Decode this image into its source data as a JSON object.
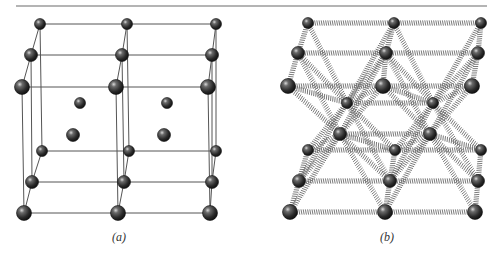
{
  "figure": {
    "rule": {
      "x1": 16,
      "x2": 487,
      "y": 6,
      "color": "#6a6a6a"
    },
    "atom_color": "#2e2e2e",
    "line_color": "#555555",
    "spring_color": "#6b6b6b",
    "panels": [
      {
        "caption": "(a)",
        "caption_pos": [
          112,
          240
        ],
        "style": "lines",
        "atoms": [
          {
            "x": 40,
            "y": 24,
            "r": 5.5
          },
          {
            "x": 127,
            "y": 24,
            "r": 5.5
          },
          {
            "x": 216,
            "y": 24,
            "r": 5.5
          },
          {
            "x": 31,
            "y": 55,
            "r": 6.5
          },
          {
            "x": 122,
            "y": 55,
            "r": 6.5
          },
          {
            "x": 212,
            "y": 55,
            "r": 6.5
          },
          {
            "x": 22,
            "y": 87,
            "r": 7.5
          },
          {
            "x": 116,
            "y": 87,
            "r": 7.5
          },
          {
            "x": 208,
            "y": 87,
            "r": 7.5
          },
          {
            "x": 80,
            "y": 103,
            "r": 5.5
          },
          {
            "x": 167,
            "y": 103,
            "r": 5.5
          },
          {
            "x": 73,
            "y": 135,
            "r": 6.5
          },
          {
            "x": 164,
            "y": 135,
            "r": 6.5
          },
          {
            "x": 42,
            "y": 151,
            "r": 5.5
          },
          {
            "x": 129,
            "y": 151,
            "r": 5.5
          },
          {
            "x": 216,
            "y": 151,
            "r": 5.5
          },
          {
            "x": 32,
            "y": 182,
            "r": 6.5
          },
          {
            "x": 124,
            "y": 182,
            "r": 6.5
          },
          {
            "x": 212,
            "y": 182,
            "r": 6.5
          },
          {
            "x": 24,
            "y": 213,
            "r": 7.5
          },
          {
            "x": 118,
            "y": 213,
            "r": 7.5
          },
          {
            "x": 210,
            "y": 213,
            "r": 7.5
          }
        ],
        "bonds": [
          [
            0,
            1
          ],
          [
            1,
            2
          ],
          [
            3,
            4
          ],
          [
            4,
            5
          ],
          [
            6,
            7
          ],
          [
            7,
            8
          ],
          [
            13,
            14
          ],
          [
            14,
            15
          ],
          [
            16,
            17
          ],
          [
            17,
            18
          ],
          [
            19,
            20
          ],
          [
            20,
            21
          ],
          [
            0,
            3
          ],
          [
            3,
            6
          ],
          [
            1,
            4
          ],
          [
            4,
            7
          ],
          [
            2,
            5
          ],
          [
            5,
            8
          ],
          [
            13,
            16
          ],
          [
            16,
            19
          ],
          [
            14,
            17
          ],
          [
            17,
            20
          ],
          [
            15,
            18
          ],
          [
            18,
            21
          ],
          [
            0,
            13
          ],
          [
            3,
            16
          ],
          [
            6,
            19
          ],
          [
            1,
            14
          ],
          [
            4,
            17
          ],
          [
            7,
            20
          ],
          [
            2,
            15
          ],
          [
            5,
            18
          ],
          [
            8,
            21
          ]
        ]
      },
      {
        "caption": "(b)",
        "caption_pos": [
          380,
          240
        ],
        "style": "springs",
        "atoms": [
          {
            "x": 308,
            "y": 23,
            "r": 5.5
          },
          {
            "x": 394,
            "y": 23,
            "r": 5.5
          },
          {
            "x": 481,
            "y": 23,
            "r": 5.5
          },
          {
            "x": 298,
            "y": 53,
            "r": 6.5
          },
          {
            "x": 386,
            "y": 53,
            "r": 6.5
          },
          {
            "x": 478,
            "y": 53,
            "r": 6.5
          },
          {
            "x": 288,
            "y": 86,
            "r": 7.5
          },
          {
            "x": 383,
            "y": 86,
            "r": 7.5
          },
          {
            "x": 472,
            "y": 86,
            "r": 7.5
          },
          {
            "x": 347,
            "y": 103,
            "r": 5.5
          },
          {
            "x": 433,
            "y": 103,
            "r": 5.5
          },
          {
            "x": 340,
            "y": 134,
            "r": 6.5
          },
          {
            "x": 430,
            "y": 134,
            "r": 6.5
          },
          {
            "x": 308,
            "y": 150,
            "r": 5.5
          },
          {
            "x": 395,
            "y": 150,
            "r": 5.5
          },
          {
            "x": 481,
            "y": 150,
            "r": 5.5
          },
          {
            "x": 299,
            "y": 181,
            "r": 6.5
          },
          {
            "x": 390,
            "y": 181,
            "r": 6.5
          },
          {
            "x": 478,
            "y": 181,
            "r": 6.5
          },
          {
            "x": 290,
            "y": 212,
            "r": 7.5
          },
          {
            "x": 385,
            "y": 212,
            "r": 7.5
          },
          {
            "x": 475,
            "y": 212,
            "r": 7.5
          }
        ],
        "bonds": [
          [
            0,
            1
          ],
          [
            1,
            2
          ],
          [
            3,
            4
          ],
          [
            4,
            5
          ],
          [
            6,
            7
          ],
          [
            7,
            8
          ],
          [
            13,
            14
          ],
          [
            14,
            15
          ],
          [
            16,
            17
          ],
          [
            17,
            18
          ],
          [
            19,
            20
          ],
          [
            20,
            21
          ],
          [
            9,
            10
          ],
          [
            11,
            12
          ],
          [
            0,
            3
          ],
          [
            3,
            6
          ],
          [
            1,
            4
          ],
          [
            4,
            7
          ],
          [
            2,
            5
          ],
          [
            5,
            8
          ],
          [
            13,
            16
          ],
          [
            16,
            19
          ],
          [
            14,
            17
          ],
          [
            17,
            20
          ],
          [
            15,
            18
          ],
          [
            18,
            21
          ],
          [
            0,
            9
          ],
          [
            1,
            9
          ],
          [
            3,
            9
          ],
          [
            4,
            9
          ],
          [
            6,
            9
          ],
          [
            7,
            9
          ],
          [
            1,
            10
          ],
          [
            2,
            10
          ],
          [
            4,
            10
          ],
          [
            5,
            10
          ],
          [
            7,
            10
          ],
          [
            8,
            10
          ],
          [
            6,
            11
          ],
          [
            7,
            11
          ],
          [
            16,
            11
          ],
          [
            17,
            11
          ],
          [
            19,
            11
          ],
          [
            20,
            11
          ],
          [
            3,
            11
          ],
          [
            4,
            11
          ],
          [
            7,
            12
          ],
          [
            8,
            12
          ],
          [
            17,
            12
          ],
          [
            18,
            12
          ],
          [
            20,
            12
          ],
          [
            21,
            12
          ],
          [
            4,
            12
          ],
          [
            5,
            12
          ],
          [
            9,
            13
          ],
          [
            9,
            14
          ],
          [
            9,
            16
          ],
          [
            9,
            17
          ],
          [
            10,
            14
          ],
          [
            10,
            15
          ],
          [
            10,
            17
          ],
          [
            10,
            18
          ],
          [
            11,
            13
          ],
          [
            11,
            14
          ],
          [
            12,
            14
          ],
          [
            12,
            15
          ]
        ]
      }
    ]
  }
}
